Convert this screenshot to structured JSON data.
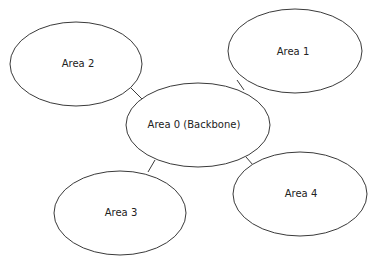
{
  "diagram": {
    "type": "network-topology",
    "nodes": [
      {
        "id": "area0",
        "label": "Area 0 (Backbone)",
        "cx": 198,
        "cy": 125,
        "rx": 72,
        "ry": 42
      },
      {
        "id": "area1",
        "label": "Area 1",
        "cx": 295,
        "cy": 51,
        "rx": 67,
        "ry": 42
      },
      {
        "id": "area2",
        "label": "Area 2",
        "cx": 76,
        "cy": 64,
        "rx": 66,
        "ry": 42
      },
      {
        "id": "area3",
        "label": "Area 3",
        "cx": 120,
        "cy": 213,
        "rx": 66,
        "ry": 42
      },
      {
        "id": "area4",
        "label": "Area 4",
        "cx": 300,
        "cy": 194,
        "rx": 67,
        "ry": 42
      }
    ],
    "edges": [
      {
        "from": "area0",
        "to": "area1"
      },
      {
        "from": "area0",
        "to": "area2"
      },
      {
        "from": "area0",
        "to": "area3"
      },
      {
        "from": "area0",
        "to": "area4"
      }
    ],
    "colors": {
      "stroke": "#3a3a3a",
      "fill": "#ffffff",
      "text": "#222222"
    }
  }
}
